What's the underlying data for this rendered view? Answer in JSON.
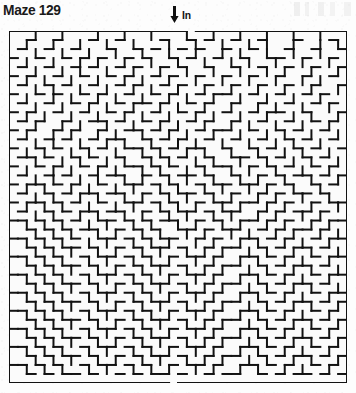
{
  "page": {
    "width": 356,
    "height": 393,
    "background_color": "#fdfdfd",
    "ink_color": "#111111"
  },
  "title": "Maze 129",
  "entrance": {
    "arrow_icon": "arrow-down-icon",
    "label": "In"
  },
  "maze": {
    "cols": 38,
    "rows": 39,
    "cell_px": 8.9,
    "wall_px": 2,
    "wall_color": "#121212",
    "paper_color": "#fbfbfb",
    "entrance_col": 19,
    "exit_col": 18,
    "origin_x": 9,
    "origin_y": 31,
    "width_px": 338,
    "height_px": 352,
    "horizontal_walls": [
      "11111111111111111111011111111111111111",
      "00100100010010000100101001001000100010",
      "01001001000100101001010010010001001001",
      "10010010101001010010100100100110010010",
      "01001001010010100101001001001001001001",
      "10100100100101001010010010010010010010",
      "01001010010010100101001001001001001001",
      "10010100101001001010010110010010010100",
      "01001001010010110100101001001001001010",
      "10100100100101001001010010010110010001",
      "01010010011010010100101001001001001010",
      "10100101001001101010010110010010100100",
      "01001010010110010101001001001001010010",
      "10010100101001101010110010010100101001",
      "01101001010010010101001001101010010100",
      "10010100101001101010010110010101001010",
      "01001010010110010101101001001010110101",
      "10110101001001101010010110110101001010",
      "01001010110110010101101001001010110100",
      "10110101001001101010010110110101001011",
      "01001010110110010101101011001010110100",
      "11010101001101010110010100110101001011",
      "00101010110010101001101011001010110100",
      "11010101001101010110010100110101001011",
      "00101011010010101101001011001010110100",
      "11010100101101010010110100110101001011",
      "00101011010010101101001011001010110100",
      "11010100101101010010110100110101001011",
      "00101011010010101101001011001010110100",
      "11010100101101010010110100110101001011",
      "00101011010010101101001011001010110101",
      "11010100101101010010110100110101001010",
      "00101011010010101101001011001010110101",
      "11010100101101010010110100110101001010",
      "00101011010010101101001011001010110101",
      "11010100101101010010110100110101001010",
      "00101011010010101101001011001010110101",
      "11010100101101010010110100110101001010",
      "00101011010010101101001011001010110101",
      "11111111111111111101111111111111111111"
    ],
    "vertical_walls": [
      "100100100010010010001001001001001001001",
      "101001001001001000100100100101001001011",
      "100100100100100100100100101001001001001",
      "101001001010010010010010010100100100101",
      "100100101001001001001001001001010010011",
      "101010010010010100100100100100100101001",
      "100101001001001010010010010010010010011",
      "101001010010100100101001001001001001001",
      "100100100101001001010010010010100100101",
      "101010010010010100100101001001001010011",
      "100100101001001001010010010100100100101",
      "101001010010100100101001001001010010011",
      "100101001001010010010100100100101001001",
      "101010010100100101001010010010010100101",
      "100100101001010010100101001001001010011",
      "101001010010100101001010010100100100101",
      "100101001010010100101001001010010010011",
      "101010010100101001010010100101001001001",
      "100101001010010100101001010010100100101",
      "101010100100101001010100101001010010011",
      "100101001010010100101001010010100101001",
      "101010100101001010010100101001010010101",
      "100101010010100101001010010100101001011",
      "101010100101001010100101001010010100101",
      "100101010010100101001010100101001010011",
      "101010100101001010100101001010010100101",
      "100101010010100101001010100101001010011",
      "101010100101001010100101001010010100101",
      "100101010010100101001010100101001010011",
      "101010100101001010100101001010010100101",
      "100101010010100101001010100101001010011",
      "101010100101001010100101001010010100101",
      "100101010010100101001010100101001010011",
      "101010100101001010100101001010010100101",
      "100101010010100101001010100101001010011",
      "101010100101001010100101001010010100101",
      "100101010010100101001010100101001010011",
      "101010100101001010100101001010010100101"
    ]
  }
}
